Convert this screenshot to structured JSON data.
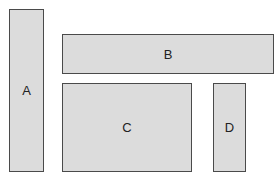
{
  "diagram": {
    "boxes": [
      {
        "id": "A",
        "label": "A"
      },
      {
        "id": "B",
        "label": "B"
      },
      {
        "id": "C",
        "label": "C"
      },
      {
        "id": "D",
        "label": "D"
      }
    ]
  },
  "colors": {
    "box_fill": "#dcdcdc",
    "box_border": "#4a4a4a",
    "label": "#222222",
    "background": "#ffffff"
  }
}
